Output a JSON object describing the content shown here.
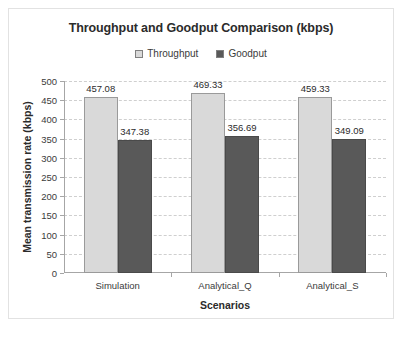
{
  "chart_data": {
    "type": "bar",
    "title": "Throughput and Goodput Comparison (kbps)",
    "xlabel": "Scenarios",
    "ylabel": "Mean transmission rate (kbps)",
    "categories": [
      "Simulation",
      "Analytical_Q",
      "Analytical_S"
    ],
    "series": [
      {
        "name": "Throughput",
        "color": "#d9d9d9",
        "values": [
          457.08,
          347.38,
          469.33
        ],
        "labels": [
          "457.08",
          "469.33",
          "459.33"
        ]
      },
      {
        "name": "Goodput",
        "color": "#595959",
        "values": [
          347.38,
          356.69,
          349.09
        ],
        "labels": [
          "347.38",
          "356.69",
          "349.09"
        ]
      }
    ],
    "series_values": [
      [
        457.08,
        469.33,
        459.33
      ],
      [
        347.38,
        356.69,
        349.09
      ]
    ],
    "ylim": [
      0,
      500
    ],
    "ytick_step": 50,
    "yticks": [
      0,
      50,
      100,
      150,
      200,
      250,
      300,
      350,
      400,
      450,
      500
    ],
    "ytick_labels": [
      "0",
      "50",
      "100",
      "150",
      "200",
      "250",
      "300",
      "350",
      "400",
      "450",
      "500"
    ],
    "grid": true,
    "grid_style": "dashed",
    "grid_color": "#cfcfcf",
    "legend_position": "top-center",
    "legend_entries": [
      "Throughput",
      "Goodput"
    ],
    "plot_background": "#ffffff",
    "border_color": "#e2e2e2"
  }
}
